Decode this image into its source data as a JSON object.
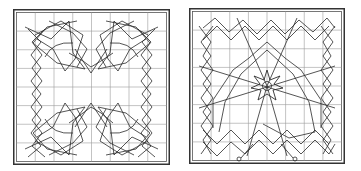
{
  "figure": {
    "panels": [
      {
        "id": "left",
        "description": "Two interlocking U-shaped knot bands on an 8x8 grid",
        "grid": {
          "rows": 8,
          "cols": 8
        },
        "colors": {
          "frame": "#333333",
          "grid": "#9a9a9a",
          "lines": "#2a2a2a"
        }
      },
      {
        "id": "right",
        "description": "Knot band border with central eight-pointed star and two end circles on an 8x8 grid",
        "grid": {
          "rows": 8,
          "cols": 8
        },
        "colors": {
          "frame": "#333333",
          "grid": "#9a9a9a",
          "lines": "#2a2a2a"
        }
      }
    ]
  }
}
